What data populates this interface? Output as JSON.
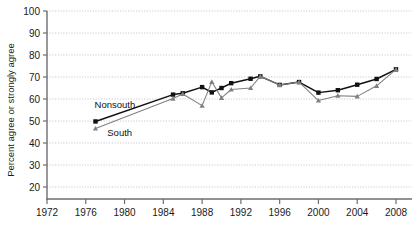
{
  "chart_data": {
    "type": "line",
    "title": "",
    "xlabel": "",
    "ylabel": "Percent agree or strongly agree",
    "xlim": [
      1972,
      2008
    ],
    "ylim": [
      20,
      100
    ],
    "xticks": [
      1972,
      1976,
      1980,
      1984,
      1988,
      1992,
      1996,
      2000,
      2004,
      2008
    ],
    "yticks": [
      20,
      30,
      40,
      50,
      60,
      70,
      80,
      90,
      100
    ],
    "grid": true,
    "legend_position": "inline-annotation",
    "annotations": [
      {
        "text": "Nonsouth",
        "x": 1979.0,
        "y": 56.0
      },
      {
        "text": "South",
        "x": 1979.5,
        "y": 43.0
      }
    ],
    "series": [
      {
        "name": "Nonsouth",
        "color": "#111111",
        "marker": "square",
        "x": [
          1977,
          1985,
          1986,
          1988,
          1989,
          1990,
          1991,
          1993,
          1994,
          1996,
          1998,
          2000,
          2002,
          2004,
          2006,
          2008
        ],
        "values": [
          49.8,
          62.0,
          62.6,
          65.4,
          63.0,
          65.0,
          67.2,
          69.2,
          70.3,
          66.4,
          67.7,
          62.9,
          64.0,
          66.5,
          69.1,
          73.5
        ]
      },
      {
        "name": "South",
        "color": "#808084",
        "marker": "triangle",
        "x": [
          1977,
          1985,
          1986,
          1988,
          1989,
          1990,
          1991,
          1993,
          1994,
          1996,
          1998,
          2000,
          2002,
          2004,
          2006,
          2008
        ],
        "values": [
          46.6,
          60.2,
          62.3,
          57.0,
          67.8,
          60.5,
          64.3,
          65.0,
          70.3,
          66.4,
          67.7,
          59.3,
          61.5,
          61.2,
          66.0,
          73.5
        ]
      }
    ]
  },
  "axis": {
    "y_label": "Percent agree or strongly agree",
    "y_tick_labels": [
      "100",
      "90",
      "80",
      "70",
      "60",
      "50",
      "40",
      "30",
      "20"
    ],
    "x_tick_labels": [
      "1972",
      "1976",
      "1980",
      "1984",
      "1988",
      "1992",
      "1996",
      "2000",
      "2004",
      "2008"
    ]
  },
  "labels": {
    "nonsouth": "Nonsouth",
    "south": "South"
  },
  "colors": {
    "nonsouth_line": "#111111",
    "south_line": "#808084",
    "grid": "#b9b9c4",
    "axis": "#6e6e72",
    "background": "#ffffff"
  }
}
